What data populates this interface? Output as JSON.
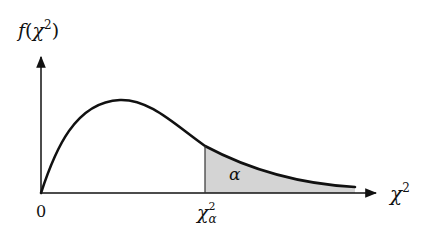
{
  "diagram": {
    "y_axis_label": {
      "func": "f",
      "var": "χ",
      "exp": "2"
    },
    "x_axis_label": {
      "var": "χ",
      "exp": "2"
    },
    "origin_label": "0",
    "critical_value_label": {
      "var": "χ",
      "exp": "2",
      "sub": "α"
    },
    "area_label": "α",
    "colors": {
      "curve": "#111111",
      "shade": "#d4d4d4",
      "axes": "#111111"
    }
  }
}
